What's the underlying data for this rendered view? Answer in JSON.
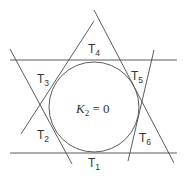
{
  "diagram": {
    "center_label": {
      "base": "K",
      "sub": "2",
      "rest": " = 0"
    },
    "regions": [
      {
        "base": "T",
        "sub": "1",
        "x": 90,
        "y": 167
      },
      {
        "base": "T",
        "sub": "2",
        "x": 37,
        "y": 139
      },
      {
        "base": "T",
        "sub": "3",
        "x": 37,
        "y": 84
      },
      {
        "base": "T",
        "sub": "4",
        "x": 88,
        "y": 53
      },
      {
        "base": "T",
        "sub": "5",
        "x": 133,
        "y": 81
      },
      {
        "base": "T",
        "sub": "6",
        "x": 141,
        "y": 143
      }
    ],
    "colors": {
      "stroke": "#4a4a4a",
      "text": "#333333",
      "background": "#ffffff"
    }
  }
}
